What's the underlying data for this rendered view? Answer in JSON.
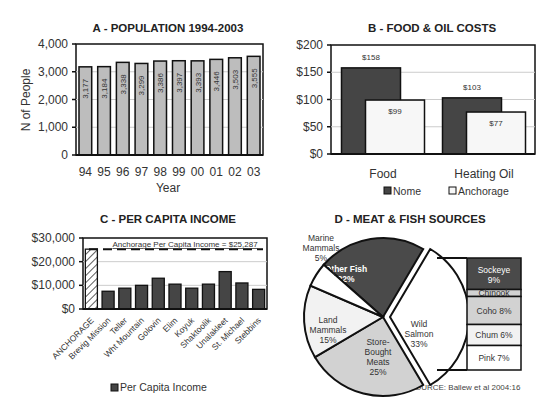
{
  "chart_data": [
    {
      "id": "A",
      "type": "bar",
      "title": "A - POPULATION 1994-2003",
      "xlabel": "Year",
      "ylabel": "N of People",
      "categories": [
        "94",
        "95",
        "96",
        "97",
        "98",
        "99",
        "00",
        "01",
        "02",
        "03"
      ],
      "values": [
        3177,
        3184,
        3338,
        3299,
        3386,
        3397,
        3393,
        3446,
        3503,
        3555
      ],
      "value_labels": [
        "3,177",
        "3,184",
        "3,338",
        "3,299",
        "3,386",
        "3,397",
        "3,393",
        "3,446",
        "3,503",
        "3,555"
      ],
      "ylim": [
        0,
        4000
      ],
      "yticks": [
        "0",
        "1,000",
        "2,000",
        "3,000",
        "4,000"
      ],
      "grid": true,
      "bar_color": "#bdbdbd"
    },
    {
      "id": "B",
      "type": "bar",
      "title": "B - FOOD & OIL COSTS",
      "categories": [
        "Food",
        "Heating Oil"
      ],
      "series": [
        {
          "name": "Nome",
          "values": [
            158,
            103
          ],
          "labels": [
            "$158",
            "$103"
          ],
          "color": "#454545"
        },
        {
          "name": "Anchorage",
          "values": [
            99,
            77
          ],
          "labels": [
            "$99",
            "$77"
          ],
          "color": "#f7f7f7"
        }
      ],
      "ylim": [
        0,
        200
      ],
      "yticks": [
        "$0",
        "$50",
        "$100",
        "$150",
        "$200"
      ],
      "legend": "bottom",
      "grid": true
    },
    {
      "id": "C",
      "type": "bar",
      "title": "C - PER CAPITA INCOME",
      "categories": [
        "ANCHORAGE",
        "Brevig Mission",
        "Teller",
        "Wht Mountain",
        "Golovin",
        "Elim",
        "Koyuk",
        "Shaktoolik",
        "Unalakleet",
        "St. Michael",
        "Stebbins"
      ],
      "values": [
        25287,
        7500,
        8800,
        10000,
        13000,
        10500,
        8800,
        10500,
        15800,
        11000,
        8300
      ],
      "ylim": [
        0,
        30000
      ],
      "yticks": [
        "$0",
        "$10,000",
        "$20,000",
        "$30,000"
      ],
      "reference_line": {
        "value": 25287,
        "label": "Anchorage Per Capita Income = $25,287"
      },
      "legend": [
        "Per Capita Income"
      ],
      "legend_position": "bottom",
      "bar_color": "#454545",
      "grid": true
    },
    {
      "id": "D",
      "type": "pie",
      "title": "D - MEAT & FISH SOURCES",
      "slices": [
        {
          "label": "Other Fish",
          "value": 22,
          "pct": "22%",
          "color": "#4a4a4a"
        },
        {
          "label": "Wild Salmon",
          "value": 33,
          "pct": "33%",
          "color": "#ffffff"
        },
        {
          "label": "Store-Bought Meats",
          "value": 25,
          "pct": "25%",
          "color": "#d2d2d2"
        },
        {
          "label": "Land Mammals",
          "value": 15,
          "pct": "15%",
          "color": "#f2f2f2"
        },
        {
          "label": "Marine Mammals",
          "value": 5,
          "pct": "5%",
          "color": "#ffffff"
        }
      ],
      "breakdown": {
        "of": "Wild Salmon",
        "items": [
          {
            "label": "Sockeye",
            "value": 9,
            "pct": "9%",
            "color": "#4a4a4a"
          },
          {
            "label": "Chinook",
            "value": 2,
            "pct": "",
            "color": "#d2d2d2"
          },
          {
            "label": "Coho",
            "value": 8,
            "pct": "8%",
            "color": "#d2d2d2"
          },
          {
            "label": "Chum",
            "value": 6,
            "pct": "6%",
            "color": "#f2f2f2"
          },
          {
            "label": "Pink",
            "value": 7,
            "pct": "7%",
            "color": "#ffffff"
          }
        ]
      },
      "source": "SOURCE: Ballew et al 2004:16"
    }
  ]
}
